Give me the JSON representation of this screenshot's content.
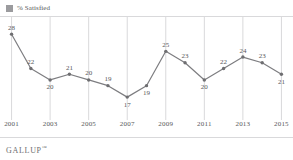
{
  "legend": {
    "swatch_color": "#9b9b9e",
    "label": "% Satisfied"
  },
  "brand": {
    "name": "GALLUP",
    "trademark": "™"
  },
  "style": {
    "line_color": "#7d7d80",
    "marker_color": "#6e6e71",
    "gridline_color": "#d9d9db",
    "rule_color": "#d9d9db",
    "label_color": "#58585a",
    "background": "#ffffff"
  },
  "chart_data": {
    "type": "line",
    "title": "",
    "subtitle": "",
    "xlabel": "",
    "ylabel": "",
    "grid": "vertical-only",
    "legend_position": "top-left",
    "x": [
      2001,
      2002,
      2003,
      2004,
      2005,
      2006,
      2007,
      2008,
      2009,
      2010,
      2011,
      2012,
      2013,
      2014,
      2015
    ],
    "categories": [
      "2001",
      "2002",
      "2003",
      "2004",
      "2005",
      "2006",
      "2007",
      "2008",
      "2009",
      "2010",
      "2011",
      "2012",
      "2013",
      "2014",
      "2015"
    ],
    "values": [
      28,
      22,
      20,
      21,
      20,
      19,
      17,
      19,
      25,
      23,
      20,
      22,
      24,
      23,
      21
    ],
    "series": [
      {
        "name": "% Satisfied",
        "values": [
          28,
          22,
          20,
          21,
          20,
          19,
          17,
          19,
          25,
          23,
          20,
          22,
          24,
          23,
          21
        ]
      }
    ],
    "data_labels": [
      "28",
      "22",
      "20",
      "21",
      "20",
      "19",
      "17",
      "19",
      "25",
      "23",
      "20",
      "22",
      "24",
      "23",
      "21"
    ],
    "data_label_positions": [
      "above",
      "above",
      "below",
      "above",
      "above",
      "above",
      "below",
      "below",
      "above",
      "above",
      "below",
      "above",
      "above",
      "above",
      "below"
    ],
    "xtick_labels": [
      "2001",
      "2003",
      "2005",
      "2007",
      "2009",
      "2011",
      "2013",
      "2015"
    ],
    "xtick_values": [
      2001,
      2003,
      2005,
      2007,
      2009,
      2011,
      2013,
      2015
    ],
    "gridline_values": [
      2001,
      2003,
      2005,
      2007,
      2009,
      2011,
      2013,
      2015
    ],
    "xlim": [
      2000.4,
      2015.6
    ],
    "ylim": [
      13,
      31
    ],
    "yaxis_visible": false,
    "ytick_labels": []
  }
}
